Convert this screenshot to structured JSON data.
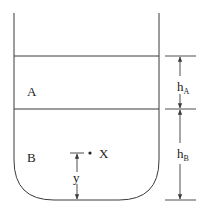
{
  "diagram": {
    "type": "container-two-liquid-layers",
    "colors": {
      "line": "#3a3a3a",
      "text": "#222222",
      "background": "#ffffff"
    },
    "layers": [
      {
        "id": "A",
        "label": "A"
      },
      {
        "id": "B",
        "label": "B"
      }
    ],
    "point": {
      "label": "X"
    },
    "dimensions": {
      "hA": {
        "main": "h",
        "sub": "A"
      },
      "hB": {
        "main": "h",
        "sub": "B"
      },
      "y": {
        "label": "y"
      }
    }
  }
}
